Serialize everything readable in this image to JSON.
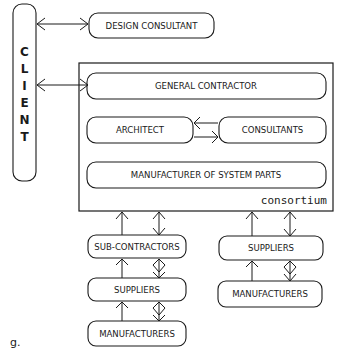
{
  "diagram": {
    "client": {
      "letters": [
        "C",
        "L",
        "I",
        "E",
        "N",
        "T"
      ]
    },
    "nodes": {
      "design_consultant": "DESIGN CONSULTANT",
      "general_contractor": "GENERAL CONTRACTOR",
      "architect": "ARCHITECT",
      "consultants": "CONSULTANTS",
      "manufacturer_system_parts": "MANUFACTURER OF SYSTEM PARTS",
      "consortium_label": "consortium",
      "sub_contractors": "SUB-CONTRACTORS",
      "suppliers_left": "SUPPLIERS",
      "manufacturers_left": "MANUFACTURERS",
      "suppliers_right": "SUPPLIERS",
      "manufacturers_right": "MANUFACTURERS"
    },
    "figure_label": "g."
  }
}
